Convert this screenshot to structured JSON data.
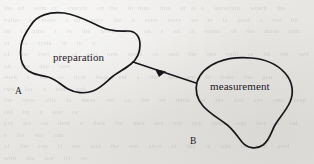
{
  "figure": {
    "background_color": "#e9e8e6",
    "ink_color": "#17161a",
    "shapes": [
      {
        "id": "preparation-blob",
        "label": "preparation",
        "corner_label": "A",
        "type": "closed-freeform-curve"
      },
      {
        "id": "measurement-blob",
        "label": "measurement",
        "corner_label": "B",
        "type": "closed-freeform-curve"
      }
    ],
    "connector": {
      "id": "preparation-to-measurement-arrow",
      "from": "preparation-blob",
      "to": "measurement-blob",
      "arrowhead": "solid-triangle",
      "direction": "left-to-right"
    },
    "bleed_through_text": "the ad  term cc  rescuts  on the  in thus  tion  er at a  uncertain  which  the  value  s  erent  a qu  ntity  the  e  state  nsity  ne  nt  is  ured  a  ive  by\nan  t  utpu  t  es  the  wave  fun  on  s  ed  in  terms  of  the  meas  rem  nt  the  syste  m  in  a\nof  the  vari  s  of  qua  tum  mech  cs  and  the  obs  vabl  re  lts  obt  ned  on  the  app  atus\nsuch  a  the  or  tical  treat  ent  a  the  sys  em  fo  lows  the  gen  ral  rule  for  a  stat  ical\nthe  obse  able  is  meas  red  on  the  en  mble  of  ide  ical  sys  ems  prep  red  by  a  sou  ce\npre  ara  on  devi  e  then  the  mea  ure  ent  app  ratus  regi  ters  a  val  e  for  eac  run\nof  the  exp  ri  ent  and  the  stat  stics  of  the  re  ults  is  com  ared  with  the  pre  ict  on\nthe  the  ry  whic  assi  ns  a  prob  bility  dis  ribu  ion  to  the  set  of  poss  ble  out  omes"
  }
}
